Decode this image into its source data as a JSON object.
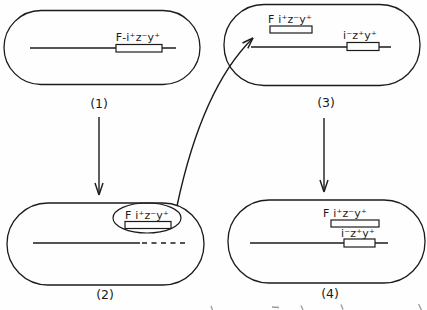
{
  "colors": {
    "ink": "#1b1b1b",
    "paper": "#fefefe"
  },
  "cells": {
    "c1": {
      "step": "(1)",
      "integrated_factor_label": "F-i⁺z⁻y⁺"
    },
    "c2": {
      "step": "(2)",
      "plasmid_label": "F i⁺z⁻y⁺"
    },
    "c3": {
      "step": "(3)",
      "plasmid_label": "F i⁺z⁻y⁺",
      "chromosome_label": "i⁻z⁺y⁺"
    },
    "c4": {
      "step": "(4)",
      "plasmid_label": "F i⁺z⁻y⁺",
      "chromosome_label": "i⁻z⁺y⁺"
    }
  }
}
